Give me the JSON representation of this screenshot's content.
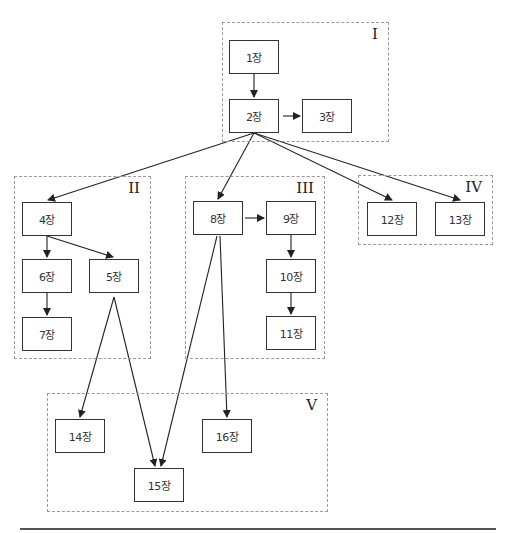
{
  "groups": [
    {
      "id": "I",
      "label": "I",
      "x": 222,
      "y": 22,
      "w": 167,
      "h": 120
    },
    {
      "id": "II",
      "label": "II",
      "x": 14,
      "y": 176,
      "w": 137,
      "h": 183
    },
    {
      "id": "III",
      "label": "III",
      "x": 185,
      "y": 176,
      "w": 140,
      "h": 183
    },
    {
      "id": "IV",
      "label": "IV",
      "x": 358,
      "y": 175,
      "w": 135,
      "h": 70
    },
    {
      "id": "V",
      "label": "V",
      "x": 47,
      "y": 393,
      "w": 281,
      "h": 119
    }
  ],
  "nodes": [
    {
      "id": "1",
      "label": "1장",
      "x": 229,
      "y": 40
    },
    {
      "id": "2",
      "label": "2장",
      "x": 229,
      "y": 99
    },
    {
      "id": "3",
      "label": "3장",
      "x": 302,
      "y": 99
    },
    {
      "id": "4",
      "label": "4장",
      "x": 22,
      "y": 202
    },
    {
      "id": "6",
      "label": "6장",
      "x": 22,
      "y": 259
    },
    {
      "id": "5",
      "label": "5장",
      "x": 89,
      "y": 259
    },
    {
      "id": "7",
      "label": "7장",
      "x": 22,
      "y": 317
    },
    {
      "id": "8",
      "label": "8장",
      "x": 193,
      "y": 201
    },
    {
      "id": "9",
      "label": "9장",
      "x": 266,
      "y": 201
    },
    {
      "id": "10",
      "label": "10장",
      "x": 266,
      "y": 259
    },
    {
      "id": "11",
      "label": "11장",
      "x": 266,
      "y": 316
    },
    {
      "id": "12",
      "label": "12장",
      "x": 367,
      "y": 202
    },
    {
      "id": "13",
      "label": "13장",
      "x": 435,
      "y": 202
    },
    {
      "id": "14",
      "label": "14장",
      "x": 55,
      "y": 419
    },
    {
      "id": "16",
      "label": "16장",
      "x": 202,
      "y": 419
    },
    {
      "id": "15",
      "label": "15장",
      "x": 134,
      "y": 468
    }
  ],
  "edges": [
    {
      "from": "1",
      "to": "2",
      "x1": 254,
      "y1": 74,
      "x2": 254,
      "y2": 97
    },
    {
      "from": "2",
      "to": "3",
      "x1": 283,
      "y1": 116,
      "x2": 300,
      "y2": 116
    },
    {
      "from": "2",
      "to": "4",
      "x1": 254,
      "y1": 133,
      "x2": 48,
      "y2": 200
    },
    {
      "from": "2",
      "to": "8",
      "x1": 254,
      "y1": 133,
      "x2": 218,
      "y2": 199
    },
    {
      "from": "2",
      "to": "12",
      "x1": 254,
      "y1": 133,
      "x2": 392,
      "y2": 200
    },
    {
      "from": "2",
      "to": "13",
      "x1": 254,
      "y1": 133,
      "x2": 460,
      "y2": 200
    },
    {
      "from": "4",
      "to": "6",
      "x1": 47,
      "y1": 236,
      "x2": 47,
      "y2": 257
    },
    {
      "from": "4",
      "to": "5",
      "x1": 47,
      "y1": 236,
      "x2": 113,
      "y2": 257
    },
    {
      "from": "6",
      "to": "7",
      "x1": 47,
      "y1": 293,
      "x2": 47,
      "y2": 315
    },
    {
      "from": "8",
      "to": "9",
      "x1": 245,
      "y1": 218,
      "x2": 264,
      "y2": 218
    },
    {
      "from": "9",
      "to": "10",
      "x1": 291,
      "y1": 235,
      "x2": 291,
      "y2": 257
    },
    {
      "from": "10",
      "to": "11",
      "x1": 291,
      "y1": 293,
      "x2": 291,
      "y2": 314
    },
    {
      "from": "5",
      "to": "14",
      "x1": 114,
      "y1": 297,
      "x2": 80,
      "y2": 417
    },
    {
      "from": "5",
      "to": "15",
      "x1": 114,
      "y1": 297,
      "x2": 155,
      "y2": 466
    },
    {
      "from": "8",
      "to": "15",
      "x1": 217,
      "y1": 236,
      "x2": 161,
      "y2": 466
    },
    {
      "from": "8",
      "to": "16",
      "x1": 220,
      "y1": 236,
      "x2": 227,
      "y2": 417
    }
  ]
}
